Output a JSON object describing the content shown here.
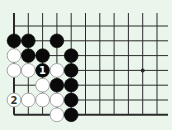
{
  "diagram": {
    "type": "go-board-fragment",
    "background": "#eaf6ec",
    "line_color": "#2a2a2a",
    "grid": {
      "columns_x": [
        14,
        28.3,
        42.6,
        56.9,
        71.2,
        85.5,
        99.8,
        114.1,
        128.4,
        142.7,
        157
      ],
      "rows_y": [
        26,
        40.8,
        55.6,
        70.4,
        85.2,
        100,
        114.8
      ],
      "top_extent": 13,
      "right_extent": 168,
      "left_edge_thick": true,
      "bottom_edge_thick": true
    },
    "star_points": [
      {
        "col": 9,
        "row": 3
      }
    ],
    "stones": [
      {
        "color": "black",
        "col": 0,
        "row": 1
      },
      {
        "color": "black",
        "col": 1,
        "row": 1
      },
      {
        "color": "black",
        "col": 3,
        "row": 1
      },
      {
        "color": "white",
        "col": 0,
        "row": 2
      },
      {
        "color": "black",
        "col": 1,
        "row": 2
      },
      {
        "color": "black",
        "col": 2,
        "row": 2
      },
      {
        "color": "black",
        "col": 4,
        "row": 2
      },
      {
        "color": "white",
        "col": 0,
        "row": 3
      },
      {
        "color": "white",
        "col": 1,
        "row": 3
      },
      {
        "color": "black",
        "col": 2,
        "row": 3,
        "label": "1"
      },
      {
        "color": "white",
        "col": 3,
        "row": 3
      },
      {
        "color": "black",
        "col": 4,
        "row": 3
      },
      {
        "color": "white",
        "col": 2,
        "row": 4
      },
      {
        "color": "black",
        "col": 3,
        "row": 4
      },
      {
        "color": "black",
        "col": 4,
        "row": 4
      },
      {
        "color": "white",
        "col": 0,
        "row": 5,
        "label": "2"
      },
      {
        "color": "white",
        "col": 1,
        "row": 5
      },
      {
        "color": "white",
        "col": 2,
        "row": 5
      },
      {
        "color": "white",
        "col": 3,
        "row": 5
      },
      {
        "color": "black",
        "col": 4,
        "row": 5
      },
      {
        "color": "white",
        "col": 3,
        "row": 6
      },
      {
        "color": "black",
        "col": 4,
        "row": 6
      }
    ],
    "move_labels": [
      "1",
      "2"
    ]
  }
}
